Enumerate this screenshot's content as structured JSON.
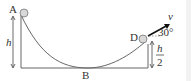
{
  "diagram": {
    "labels": {
      "A": "A",
      "B": "B",
      "D": "D",
      "h": "h",
      "h_half_num": "h",
      "h_half_den": "2",
      "v": "v",
      "angle": "30°"
    },
    "colors": {
      "line": "#555555",
      "ball_fill": "#d8d8d8",
      "arrow": "#111111"
    }
  }
}
